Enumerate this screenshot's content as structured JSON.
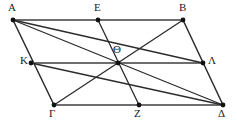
{
  "figure": {
    "kind": "geometry-diagram",
    "width": 238,
    "height": 123,
    "background_color": "#ffffff",
    "edge_color": "#6e6e6e",
    "diagonal_color": "#2b2b2b",
    "point_color": "#111111",
    "label_color": "#1a1a1a"
  },
  "points": [
    {
      "id": "A",
      "label": "Α",
      "x": 13,
      "y": 20,
      "label_x": 8,
      "label_y": 2,
      "dot": true
    },
    {
      "id": "E",
      "label": "Ε",
      "x": 98,
      "y": 20,
      "label_x": 94,
      "label_y": 2,
      "dot": true
    },
    {
      "id": "B",
      "label": "Β",
      "x": 183,
      "y": 20,
      "label_x": 179,
      "label_y": 2,
      "dot": true
    },
    {
      "id": "K",
      "label": "Κ",
      "x": 31,
      "y": 63,
      "label_x": 20,
      "label_y": 55,
      "dot": true
    },
    {
      "id": "Theta",
      "label": "Θ",
      "x": 118,
      "y": 63,
      "label_x": 113,
      "label_y": 44,
      "dot": true
    },
    {
      "id": "L",
      "label": "Λ",
      "x": 203,
      "y": 63,
      "label_x": 208,
      "label_y": 55,
      "dot": true
    },
    {
      "id": "G",
      "label": "Γ",
      "x": 54,
      "y": 105,
      "label_x": 49,
      "label_y": 108,
      "dot": true
    },
    {
      "id": "Z",
      "label": "Ζ",
      "x": 139,
      "y": 105,
      "label_x": 134,
      "label_y": 108,
      "dot": true
    },
    {
      "id": "D",
      "label": "Δ",
      "x": 223,
      "y": 105,
      "label_x": 218,
      "label_y": 108,
      "dot": true
    }
  ],
  "segments": [
    {
      "id": "AB",
      "from": "A",
      "to": "B",
      "role": "side",
      "color": "#6e6e6e",
      "width": 2.1
    },
    {
      "id": "GD",
      "from": "G",
      "to": "D",
      "role": "side",
      "color": "#6e6e6e",
      "width": 2.1
    },
    {
      "id": "AG",
      "from": "A",
      "to": "G",
      "role": "side",
      "color": "#2b2b2b",
      "width": 1.5
    },
    {
      "id": "BD",
      "from": "B",
      "to": "D",
      "role": "side",
      "color": "#2b2b2b",
      "width": 1.5
    },
    {
      "id": "KL",
      "from": "K",
      "to": "L",
      "role": "midsegment",
      "color": "#6e6e6e",
      "width": 2.1
    },
    {
      "id": "EZ",
      "from": "E",
      "to": "Z",
      "role": "midsegment",
      "color": "#2b2b2b",
      "width": 1.3
    },
    {
      "id": "AD",
      "from": "A",
      "to": "D",
      "role": "diagonal",
      "color": "#2b2b2b",
      "width": 1.3
    },
    {
      "id": "BG",
      "from": "B",
      "to": "G",
      "role": "diagonal",
      "color": "#2b2b2b",
      "width": 1.3
    },
    {
      "id": "AL",
      "from": "A",
      "to": "L",
      "role": "cevian",
      "color": "#2b2b2b",
      "width": 1.3
    },
    {
      "id": "KD",
      "from": "K",
      "to": "D",
      "role": "cevian",
      "color": "#2b2b2b",
      "width": 1.3
    }
  ],
  "point_radius": 2.4
}
